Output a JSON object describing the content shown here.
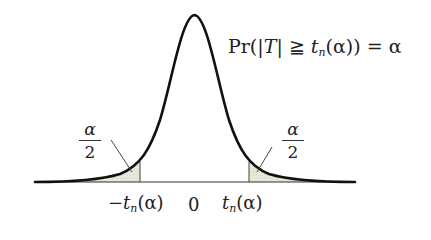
{
  "diagram": {
    "type": "t-distribution two-tailed critical region",
    "formula": {
      "prefix": "Pr(|",
      "var": "T",
      "mid": "| ≧ ",
      "t": "t",
      "sub": "n",
      "arg": "(α)) = α"
    },
    "tail_left": {
      "num": "α",
      "den": "2"
    },
    "tail_right": {
      "num": "α",
      "den": "2"
    },
    "axis_labels": {
      "neg_crit": {
        "minus": "−",
        "t": "t",
        "sub": "n",
        "arg": "(α)"
      },
      "zero": "0",
      "pos_crit": {
        "t": "t",
        "sub": "n",
        "arg": "(α)"
      }
    },
    "colors": {
      "curve": "#111111",
      "shade": "#e4ead8",
      "axis": "#333333"
    }
  }
}
